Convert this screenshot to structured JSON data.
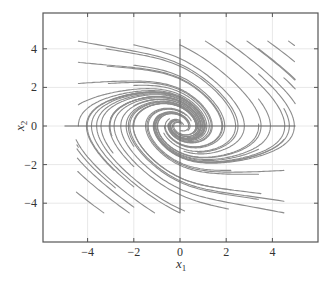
{
  "chart_data": {
    "type": "streamplot",
    "title": "",
    "xlabel": "x1",
    "ylabel": "x2",
    "xlim": [
      -5.5,
      6
    ],
    "ylim": [
      -6,
      6
    ],
    "xticks": [
      -4,
      -2,
      0,
      2,
      4
    ],
    "yticks": [
      -4,
      -2,
      0,
      2,
      4
    ],
    "xtick_labels": [
      "−4",
      "−2",
      "0",
      "2",
      "4"
    ],
    "ytick_labels": [
      "−4",
      "−2",
      "0",
      "2",
      "4"
    ],
    "grid": true,
    "reference_lines": {
      "x": 0,
      "y": 0,
      "x_extent": [
        -5,
        5
      ],
      "y_extent": [
        -4.5,
        4.5
      ]
    },
    "equilibrium": {
      "type": "stable focus",
      "x": 0,
      "y": 0
    },
    "stream_color": "#8c8c8c",
    "frame_color": "#555555",
    "grid_color": "#e8e8e8"
  },
  "axes": {
    "xlabel_main": "x",
    "xlabel_sub": "1",
    "ylabel_main": "x",
    "ylabel_sub": "2"
  }
}
